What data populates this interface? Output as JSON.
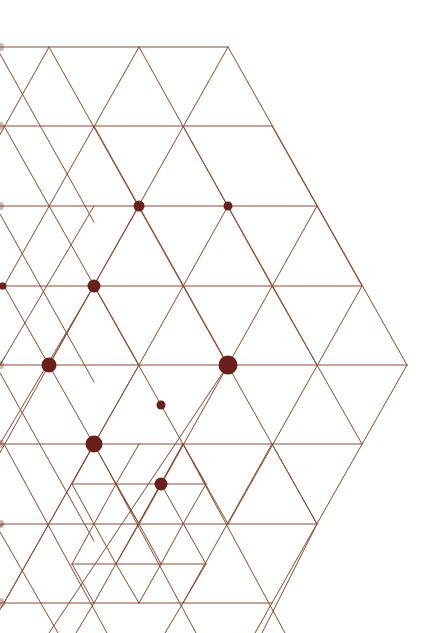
{
  "diagram": {
    "title": "",
    "colors": {
      "background": "#ffffff",
      "line": "#8a4b32",
      "dot": "#6b1f1a",
      "edge_mark": "#c9b8b2"
    },
    "horizontal_lines": [
      [
        0,
        47,
        228,
        47
      ],
      [
        0,
        126,
        272,
        126
      ],
      [
        0,
        206,
        317,
        206
      ],
      [
        0,
        286,
        362,
        286
      ],
      [
        0,
        365,
        407,
        365
      ],
      [
        0,
        444,
        362,
        444
      ],
      [
        72,
        484,
        206,
        484
      ],
      [
        0,
        524,
        317,
        524
      ],
      [
        72,
        564,
        206,
        564
      ],
      [
        0,
        603,
        272,
        603
      ]
    ],
    "diagonal_lines": [
      [
        49,
        47,
        -40,
        206
      ],
      [
        139,
        47,
        4,
        286
      ],
      [
        228,
        47,
        49,
        365
      ],
      [
        0,
        54,
        94,
        222
      ],
      [
        49,
        47,
        183,
        286
      ],
      [
        139,
        47,
        272,
        286
      ],
      [
        228,
        47,
        407,
        365
      ],
      [
        317,
        206,
        139,
        524
      ],
      [
        362,
        286,
        228,
        524
      ],
      [
        407,
        365,
        272,
        603
      ],
      [
        0,
        214,
        94,
        382
      ],
      [
        0,
        373,
        94,
        541
      ],
      [
        0,
        532,
        58,
        633
      ],
      [
        4,
        126,
        139,
        365
      ],
      [
        4,
        286,
        139,
        524
      ],
      [
        4,
        444,
        107,
        633
      ],
      [
        94,
        126,
        228,
        365
      ],
      [
        94,
        286,
        228,
        524
      ],
      [
        94,
        444,
        196,
        633
      ],
      [
        183,
        126,
        317,
        365
      ],
      [
        183,
        286,
        317,
        524
      ],
      [
        183,
        444,
        285,
        633
      ],
      [
        272,
        126,
        362,
        286
      ],
      [
        272,
        286,
        362,
        444
      ],
      [
        272,
        444,
        317,
        524
      ],
      [
        0,
        365,
        4,
        358
      ],
      [
        49,
        365,
        -40,
        524
      ],
      [
        139,
        365,
        4,
        603
      ],
      [
        228,
        365,
        49,
        633
      ],
      [
        94,
        444,
        4,
        603
      ],
      [
        183,
        444,
        94,
        603
      ],
      [
        272,
        444,
        183,
        603
      ],
      [
        317,
        524,
        262,
        633
      ],
      [
        0,
        526,
        4,
        524
      ],
      [
        0,
        365,
        94,
        206
      ],
      [
        139,
        206,
        49,
        365
      ],
      [
        228,
        206,
        139,
        365
      ],
      [
        139,
        365,
        94,
        444
      ],
      [
        94,
        286,
        0,
        444
      ],
      [
        272,
        603,
        255,
        633
      ],
      [
        4,
        603,
        -14,
        633
      ],
      [
        94,
        603,
        76,
        633
      ],
      [
        183,
        603,
        165,
        633
      ],
      [
        139,
        524,
        161,
        564
      ],
      [
        206,
        484,
        183,
        524
      ],
      [
        72,
        484,
        116,
        564
      ],
      [
        116,
        484,
        139,
        524
      ],
      [
        161,
        484,
        206,
        564
      ],
      [
        72,
        564,
        94,
        603
      ],
      [
        116,
        564,
        139,
        524
      ],
      [
        161,
        564,
        183,
        524
      ],
      [
        206,
        564,
        183,
        603
      ],
      [
        72,
        484,
        94,
        444
      ],
      [
        116,
        484,
        94,
        524
      ],
      [
        161,
        484,
        139,
        524
      ],
      [
        206,
        484,
        183,
        444
      ],
      [
        72,
        564,
        94,
        524
      ],
      [
        116,
        564,
        139,
        603
      ],
      [
        161,
        564,
        139,
        603
      ],
      [
        116,
        484,
        139,
        444
      ],
      [
        161,
        484,
        183,
        444
      ]
    ],
    "edge_marks": [
      {
        "cy": 47,
        "r": 3
      },
      {
        "cy": 126,
        "r": 3
      },
      {
        "cy": 206,
        "r": 3
      },
      {
        "cy": 286,
        "r": 3
      },
      {
        "cy": 365,
        "r": 3
      },
      {
        "cy": 444,
        "r": 3
      },
      {
        "cy": 524,
        "r": 3
      },
      {
        "cy": 603,
        "r": 4
      }
    ],
    "dots": [
      {
        "cx": 139,
        "cy": 206,
        "r": 5.5
      },
      {
        "cx": 228,
        "cy": 206,
        "r": 4.5
      },
      {
        "cx": 94,
        "cy": 286,
        "r": 6.5
      },
      {
        "cx": 3,
        "cy": 286,
        "r": 3.5
      },
      {
        "cx": 49,
        "cy": 365,
        "r": 7.5
      },
      {
        "cx": 228,
        "cy": 365,
        "r": 9.5
      },
      {
        "cx": 161,
        "cy": 405,
        "r": 4.5
      },
      {
        "cx": 94,
        "cy": 444,
        "r": 8.5
      },
      {
        "cx": 161,
        "cy": 484,
        "r": 6.5
      }
    ]
  }
}
